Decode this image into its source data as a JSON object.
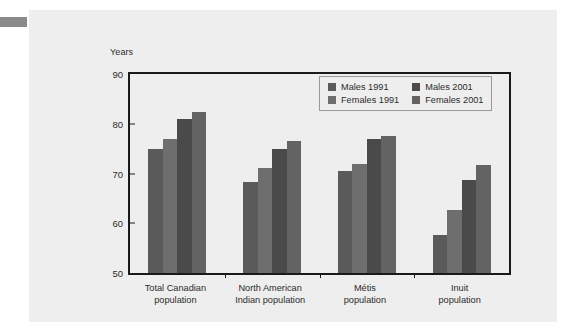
{
  "figure": {
    "axis_caption": "Years"
  },
  "chart_data": {
    "type": "bar",
    "title": "",
    "xlabel": "",
    "ylabel": "Years",
    "ylim": [
      50,
      90
    ],
    "yticks": [
      50,
      60,
      70,
      80,
      90
    ],
    "ytick_labels": [
      "50",
      "60",
      "70",
      "80",
      "90"
    ],
    "grid": false,
    "legend_position": "top-right",
    "categories": [
      "Total Canadian population",
      "North American Indian population",
      "Métis population",
      "Inuit population"
    ],
    "category_lines": [
      [
        "Total Canadian",
        "population"
      ],
      [
        "North American",
        "Indian population"
      ],
      [
        "Métis",
        "population"
      ],
      [
        "Inuit",
        "population"
      ]
    ],
    "series": [
      {
        "name": "Males 1991",
        "color": "#5a5a5a",
        "values": [
          74.9,
          68.2,
          70.6,
          57.6
        ]
      },
      {
        "name": "Females 1991",
        "color": "#6e6e6e",
        "values": [
          77.0,
          71.2,
          71.9,
          62.6
        ]
      },
      {
        "name": "Males 2001",
        "color": "#4a4a4a",
        "values": [
          81.0,
          74.9,
          76.9,
          68.7
        ]
      },
      {
        "name": "Females 2001",
        "color": "#636363",
        "values": [
          82.3,
          76.5,
          77.6,
          71.8
        ]
      }
    ]
  }
}
